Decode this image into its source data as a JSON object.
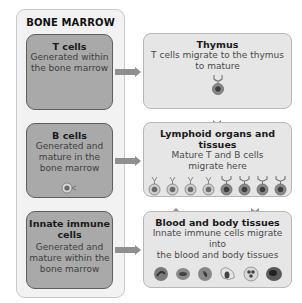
{
  "bone_marrow": {
    "title": "BONE MARROW",
    "boxes": [
      {
        "title": "T cells",
        "description_lines": [
          "Generated within",
          "the bone marrow"
        ]
      },
      {
        "title": "B cells",
        "description_lines": [
          "Generated and",
          "mature in the",
          "bone marrow"
        ]
      },
      {
        "title_lines": [
          "Innate immune",
          "cells"
        ],
        "description_lines": [
          "Generated and",
          "mature within the",
          "bone marrow"
        ]
      }
    ]
  },
  "destinations": [
    {
      "title": "Thymus",
      "description_lines": [
        "T cells migrate to the thymus",
        "to mature"
      ],
      "icon": "t-cell-icon"
    },
    {
      "title": "Lymphoid organs and tissues",
      "description_lines": [
        "Mature T and B cells",
        "migrate here"
      ],
      "icons": [
        "b-cell-icon",
        "b-cell-icon",
        "b-cell-icon",
        "b-cell-icon",
        "t-cell-icon",
        "t-cell-icon",
        "t-cell-icon",
        "t-cell-icon"
      ]
    },
    {
      "title": "Blood and body tissues",
      "description_lines": [
        "Innate immune cells migrate into",
        "the blood and body tissues"
      ],
      "icons": [
        "neutrophil-icon",
        "eosinophil-icon",
        "monocyte-icon",
        "macrophage-icon",
        "mast-cell-icon",
        "dendritic-cell-icon"
      ]
    }
  ],
  "colors": {
    "left_box_fill": "#a9a9a9",
    "left_box_border": "#5e5e5e",
    "right_box_fill": "#e6e6e6",
    "outer_fill": "#f2f2f2",
    "arrow": "#8f8f8f"
  }
}
